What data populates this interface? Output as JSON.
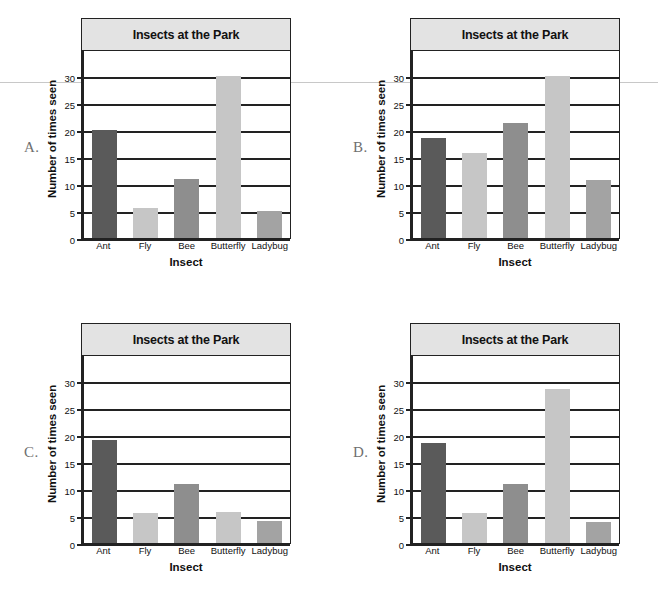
{
  "page": {
    "options": [
      "A.",
      "B.",
      "C.",
      "D."
    ]
  },
  "axis": {
    "ylabel": "Number of times seen",
    "xlabel": "Insect",
    "yticks": [
      0,
      5,
      10,
      15,
      20,
      25,
      30
    ],
    "categories": [
      "Ant",
      "Fly",
      "Bee",
      "Butterfly",
      "Ladybug"
    ]
  },
  "colors": {
    "bar_dark": "#5a5a5a",
    "bar_medium": "#8e8e8e",
    "bar_light": "#c6c6c6",
    "bar_mid_light": "#a3a3a3",
    "title_bar_bg": "#e3e3e3",
    "frame": "#222222",
    "letter": "#6f6f6f"
  },
  "chart_data": [
    {
      "id": "A",
      "type": "bar",
      "title": "Insects at the Park",
      "xlabel": "Insect",
      "ylabel": "Number of times seen",
      "categories": [
        "Ant",
        "Fly",
        "Bee",
        "Butterfly",
        "Ladybug"
      ],
      "values": [
        20,
        5.5,
        11,
        30,
        5
      ],
      "bar_colors": [
        "#5a5a5a",
        "#c6c6c6",
        "#8e8e8e",
        "#c6c6c6",
        "#a3a3a3"
      ],
      "ylim": [
        0,
        35
      ],
      "yticks": [
        0,
        5,
        10,
        15,
        20,
        25,
        30
      ],
      "grid": true,
      "legend": "none"
    },
    {
      "id": "B",
      "type": "bar",
      "title": "Insects at the Park",
      "xlabel": "Insect",
      "ylabel": "Number of times seen",
      "categories": [
        "Ant",
        "Fly",
        "Bee",
        "Butterfly",
        "Ladybug"
      ],
      "values": [
        18.5,
        15.8,
        21.3,
        30,
        10.8
      ],
      "bar_colors": [
        "#5a5a5a",
        "#c6c6c6",
        "#8e8e8e",
        "#c6c6c6",
        "#a3a3a3"
      ],
      "ylim": [
        0,
        35
      ],
      "yticks": [
        0,
        5,
        10,
        15,
        20,
        25,
        30
      ],
      "grid": true,
      "legend": "none"
    },
    {
      "id": "C",
      "type": "bar",
      "title": "Insects at the Park",
      "xlabel": "Insect",
      "ylabel": "Number of times seen",
      "categories": [
        "Ant",
        "Fly",
        "Bee",
        "Butterfly",
        "Ladybug"
      ],
      "values": [
        19,
        5.5,
        11,
        5.8,
        4
      ],
      "bar_colors": [
        "#5a5a5a",
        "#c6c6c6",
        "#8e8e8e",
        "#c6c6c6",
        "#a3a3a3"
      ],
      "ylim": [
        0,
        35
      ],
      "yticks": [
        0,
        5,
        10,
        15,
        20,
        25,
        30
      ],
      "grid": true,
      "legend": "none"
    },
    {
      "id": "D",
      "type": "bar",
      "title": "Insects at the Park",
      "xlabel": "Insect",
      "ylabel": "Number of times seen",
      "categories": [
        "Ant",
        "Fly",
        "Bee",
        "Butterfly",
        "Ladybug"
      ],
      "values": [
        18.5,
        5.6,
        11,
        28.5,
        3.8
      ],
      "bar_colors": [
        "#5a5a5a",
        "#c6c6c6",
        "#8e8e8e",
        "#c6c6c6",
        "#a3a3a3"
      ],
      "ylim": [
        0,
        35
      ],
      "yticks": [
        0,
        5,
        10,
        15,
        20,
        25,
        30
      ],
      "grid": true,
      "legend": "none"
    }
  ]
}
